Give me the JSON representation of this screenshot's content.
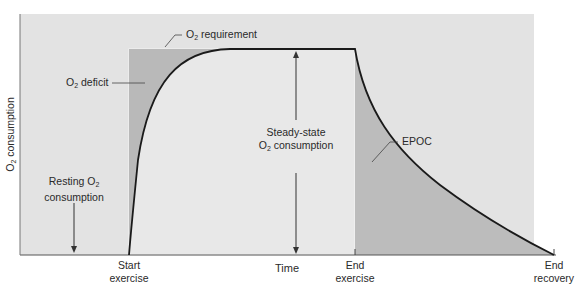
{
  "diagram": {
    "axes": {
      "y_label_prefix": "O",
      "y_label_sub": "2",
      "y_label_suffix": " consumption",
      "x_label": "Time"
    },
    "x_markers": [
      {
        "line1": "Start",
        "line2": "exercise"
      },
      {
        "line1": "End",
        "line2": "exercise"
      },
      {
        "line1": "End",
        "line2": "recovery"
      }
    ],
    "annotations": {
      "o2_requirement": {
        "prefix": "O",
        "sub": "2",
        "suffix": " requirement"
      },
      "o2_deficit": {
        "prefix": "O",
        "sub": "2",
        "suffix": " deficit"
      },
      "steady_state": {
        "line1": "Steady-state",
        "line2_prefix": "O",
        "line2_sub": "2",
        "line2_suffix": " consumption"
      },
      "resting": {
        "line1_prefix": "Resting O",
        "line1_sub": "2",
        "line2": "consumption"
      },
      "epoc": "EPOC"
    },
    "colors": {
      "background_panel": "#e4e4e4",
      "shaded_region": "#b8b8b8",
      "curve": "#1a1a1a",
      "requirement_box": "#f2f2f2"
    }
  }
}
